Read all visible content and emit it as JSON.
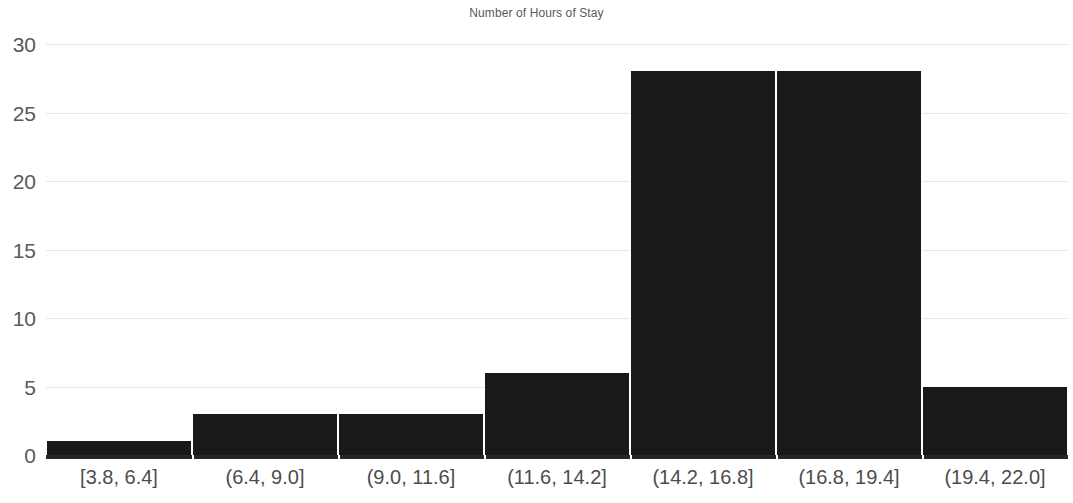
{
  "chart_data": {
    "type": "bar",
    "title": "Number of Hours of Stay",
    "xlabel": "",
    "ylabel": "",
    "categories": [
      "[3.8, 6.4]",
      "(6.4, 9.0]",
      "(9.0, 11.6]",
      "(11.6, 14.2]",
      "(14.2, 16.8]",
      "(16.8, 19.4]",
      "(19.4, 22.0]"
    ],
    "values": [
      1,
      3,
      3,
      6,
      28,
      28,
      5
    ],
    "ylim": [
      0,
      30
    ],
    "yticks": [
      0,
      5,
      10,
      15,
      20,
      25,
      30
    ],
    "ytick_labels": [
      "0",
      "5",
      "10",
      "15",
      "20",
      "25",
      "30"
    ],
    "grid": true,
    "legend": false,
    "legend_position": "none",
    "bar_color": "#191919",
    "grid_color": "#e8e8e8",
    "axis_color": "#262626",
    "title_color": "#595959",
    "tick_label_color": "#595959"
  }
}
